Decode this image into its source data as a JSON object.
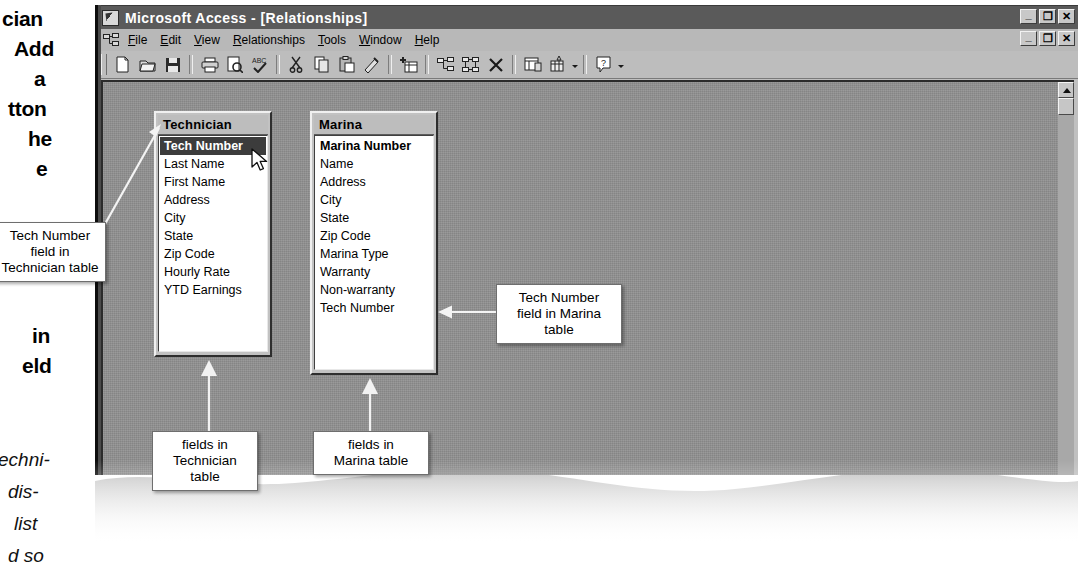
{
  "window": {
    "app_title": "Microsoft Access - [Relationships]",
    "title_icon": "access-key-icon",
    "app_controls": [
      {
        "name": "minimize",
        "glyph": "_"
      },
      {
        "name": "restore",
        "glyph": "❐"
      },
      {
        "name": "close",
        "glyph": "✕"
      }
    ],
    "child_controls": [
      {
        "name": "minimize",
        "glyph": "_"
      },
      {
        "name": "restore",
        "glyph": "❐"
      },
      {
        "name": "close",
        "glyph": "✕"
      }
    ]
  },
  "menubar": {
    "system_icon": "relationships-icon",
    "items": [
      {
        "label": "File",
        "mnemonic": "F"
      },
      {
        "label": "Edit",
        "mnemonic": "E"
      },
      {
        "label": "View",
        "mnemonic": "V"
      },
      {
        "label": "Relationships",
        "mnemonic": "R"
      },
      {
        "label": "Tools",
        "mnemonic": "T"
      },
      {
        "label": "Window",
        "mnemonic": "W"
      },
      {
        "label": "Help",
        "mnemonic": "H"
      }
    ]
  },
  "toolbar": {
    "buttons": [
      {
        "name": "new-icon",
        "tip": "New"
      },
      {
        "name": "open-folder-icon",
        "tip": "Open"
      },
      {
        "name": "save-disk-icon",
        "tip": "Save"
      },
      {
        "name": "print-icon",
        "tip": "Print"
      },
      {
        "name": "print-preview-icon",
        "tip": "Print Preview"
      },
      {
        "name": "spelling-check-icon",
        "tip": "Spelling"
      },
      {
        "name": "cut-scissors-icon",
        "tip": "Cut"
      },
      {
        "name": "copy-icon",
        "tip": "Copy"
      },
      {
        "name": "paste-icon",
        "tip": "Paste"
      },
      {
        "name": "format-painter-icon",
        "tip": "Format Painter"
      },
      {
        "name": "show-table-icon",
        "tip": "Show Table"
      },
      {
        "name": "show-direct-relationships-icon",
        "tip": "Show Direct Relationships"
      },
      {
        "name": "show-all-relationships-icon",
        "tip": "Show All Relationships"
      },
      {
        "name": "clear-layout-icon",
        "tip": "Clear Layout"
      },
      {
        "name": "database-window-icon",
        "tip": "Database Window"
      },
      {
        "name": "new-object-icon",
        "tip": "New Object"
      },
      {
        "name": "help-question-icon",
        "tip": "Office Assistant"
      }
    ]
  },
  "tables": [
    {
      "name": "Technician",
      "fields": [
        {
          "label": "Tech Number",
          "primary_key": true,
          "selected": true
        },
        {
          "label": "Last Name",
          "primary_key": false,
          "selected": false
        },
        {
          "label": "First Name",
          "primary_key": false,
          "selected": false
        },
        {
          "label": "Address",
          "primary_key": false,
          "selected": false
        },
        {
          "label": "City",
          "primary_key": false,
          "selected": false
        },
        {
          "label": "State",
          "primary_key": false,
          "selected": false
        },
        {
          "label": "Zip Code",
          "primary_key": false,
          "selected": false
        },
        {
          "label": "Hourly Rate",
          "primary_key": false,
          "selected": false
        },
        {
          "label": "YTD Earnings",
          "primary_key": false,
          "selected": false
        }
      ]
    },
    {
      "name": "Marina",
      "fields": [
        {
          "label": "Marina Number",
          "primary_key": true,
          "selected": false
        },
        {
          "label": "Name",
          "primary_key": false,
          "selected": false
        },
        {
          "label": "Address",
          "primary_key": false,
          "selected": false
        },
        {
          "label": "City",
          "primary_key": false,
          "selected": false
        },
        {
          "label": "State",
          "primary_key": false,
          "selected": false
        },
        {
          "label": "Zip Code",
          "primary_key": false,
          "selected": false
        },
        {
          "label": "Marina Type",
          "primary_key": false,
          "selected": false
        },
        {
          "label": "Warranty",
          "primary_key": false,
          "selected": false
        },
        {
          "label": "Non-warranty",
          "primary_key": false,
          "selected": false
        },
        {
          "label": "Tech Number",
          "primary_key": false,
          "selected": false
        }
      ]
    }
  ],
  "callouts": {
    "tech_number_technician": "Tech Number\nfield in\nTechnician table",
    "tech_number_marina": "Tech Number\nfield in Marina\ntable",
    "fields_technician": "fields in\nTechnician\ntable",
    "fields_marina": "fields in\nMarina table"
  },
  "margin_text": {
    "bold_lines": [
      "cian",
      "Add",
      "a",
      "tton",
      "he",
      "e"
    ],
    "bold_lines_2": [
      "in",
      "eld"
    ],
    "italic_lines": [
      "echni-",
      "dis-",
      "list",
      "d so"
    ]
  },
  "cursor": {
    "name": "mouse-pointer",
    "x": 247,
    "y": 152
  },
  "scrollbar": {
    "orientation": "vertical",
    "position": "top"
  },
  "colors": {
    "titlebar": "#5a5a5a",
    "chrome": "#bdbdbd",
    "client_bg": "#8e8e8e",
    "selection": "#3c3c3c",
    "callout_bg": "#ffffff"
  }
}
